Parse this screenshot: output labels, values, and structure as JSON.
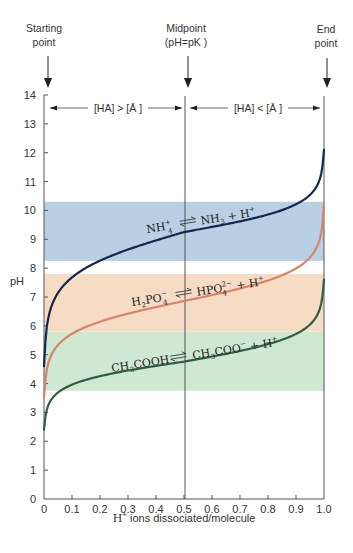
{
  "chart_data": {
    "type": "line",
    "title": "",
    "xlabel": "H+ ions dissociated/molecule",
    "xlabel_parts": {
      "main": "H",
      "sup": "+",
      "rest": " ions dissociated/molecule"
    },
    "ylabel": "pH",
    "xlim": [
      0,
      1.0
    ],
    "ylim": [
      0,
      14
    ],
    "x_ticks": [
      "0",
      "0.1",
      "0.2",
      "0.3",
      "0.4",
      "0.5",
      "0.6",
      "0.7",
      "0.8",
      "0.9",
      "1.0"
    ],
    "y_ticks": [
      "0",
      "1",
      "2",
      "3",
      "4",
      "5",
      "6",
      "7",
      "8",
      "9",
      "10",
      "11",
      "12",
      "13",
      "14"
    ],
    "grid": false,
    "markers": {
      "start": {
        "label_line1": "Starting",
        "label_line2": "point",
        "x": 0
      },
      "mid": {
        "label_line1": "Midpoint",
        "label_line2": "(pH=pK )",
        "x": 0.5
      },
      "end": {
        "label_line1": "End",
        "label_line2": "point",
        "x": 1.0
      }
    },
    "regions": {
      "left": "[HA] > [Ā  ]",
      "right": "[HA] < [Ā  ]"
    },
    "buffer_bands": [
      {
        "name": "ammonium",
        "ymin": 8.25,
        "ymax": 10.3,
        "color": "#b9cfe3"
      },
      {
        "name": "phosphate",
        "ymin": 5.8,
        "ymax": 7.8,
        "color": "#f6dcc4"
      },
      {
        "name": "acetate",
        "ymin": 3.75,
        "ymax": 5.8,
        "color": "#cfe8d2"
      }
    ],
    "series": [
      {
        "name": "NH4+ <=> NH3 + H+",
        "pKa": 9.25,
        "color": "#14284f",
        "x": [
          0.0,
          0.005,
          0.01,
          0.02,
          0.04,
          0.07,
          0.1,
          0.15,
          0.2,
          0.3,
          0.4,
          0.5,
          0.6,
          0.7,
          0.8,
          0.85,
          0.9,
          0.93,
          0.96,
          0.98,
          0.99,
          1.0
        ],
        "y": [
          4.6,
          6.9,
          7.25,
          7.56,
          7.87,
          8.13,
          8.3,
          8.5,
          8.65,
          8.88,
          9.07,
          9.25,
          9.43,
          9.62,
          9.85,
          10.0,
          10.2,
          10.37,
          10.63,
          10.94,
          11.25,
          12.1
        ]
      },
      {
        "name": "H2PO4- <=> HPO4(2-) + H+",
        "pKa": 6.86,
        "color": "#d9836b",
        "x": [
          0.0,
          0.005,
          0.01,
          0.02,
          0.04,
          0.07,
          0.1,
          0.15,
          0.2,
          0.3,
          0.4,
          0.5,
          0.6,
          0.7,
          0.8,
          0.85,
          0.9,
          0.93,
          0.96,
          0.98,
          0.99,
          1.0
        ],
        "y": [
          3.5,
          4.56,
          4.86,
          5.17,
          5.48,
          5.74,
          5.91,
          6.11,
          6.26,
          6.49,
          6.68,
          6.86,
          7.04,
          7.23,
          7.46,
          7.61,
          7.81,
          7.98,
          8.24,
          8.55,
          8.86,
          10.2
        ]
      },
      {
        "name": "CH3COOH <=> CH3COO- + H+",
        "pKa": 4.76,
        "color": "#2e5e43",
        "x": [
          0.0,
          0.005,
          0.01,
          0.02,
          0.04,
          0.07,
          0.1,
          0.15,
          0.2,
          0.3,
          0.4,
          0.5,
          0.6,
          0.7,
          0.8,
          0.85,
          0.9,
          0.93,
          0.96,
          0.98,
          0.99,
          1.0
        ],
        "y": [
          2.4,
          2.94,
          3.17,
          3.47,
          3.78,
          4.04,
          4.21,
          4.41,
          4.56,
          4.79,
          4.98,
          4.76,
          4.94,
          5.13,
          5.36,
          5.51,
          5.71,
          5.88,
          6.14,
          6.45,
          6.76,
          7.6
        ]
      }
    ],
    "equations": {
      "ammonium": {
        "a": "NH",
        "a_sup": "+",
        "a_sub": "4",
        "b": "NH",
        "b_sub": "3",
        "c": " + H",
        "c_sup": "+"
      },
      "phosphate": {
        "a": "H",
        "a_sub": "2",
        "a2": "PO",
        "a_sup": "−",
        "a_sub2": "4",
        "b": "HPO",
        "b_sup": "2−",
        "b_sub": "4",
        "c": " + H",
        "c_sup": "+"
      },
      "acetate": {
        "a": "CH",
        "a_sub": "3",
        "a2": "COOH",
        "b": "CH",
        "b_sub": "3",
        "b2": "COO",
        "b_sup": "−",
        "c": " + H",
        "c_sup": "+"
      }
    }
  }
}
